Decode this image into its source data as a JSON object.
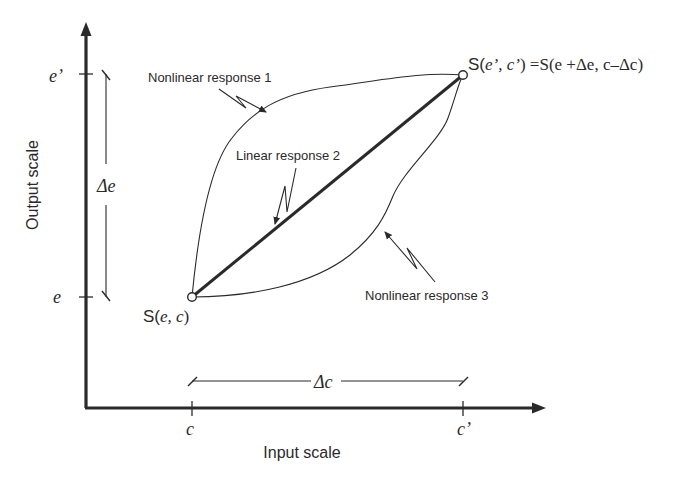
{
  "axes": {
    "x_label": "Input scale",
    "y_label": "Output scale",
    "x_ticks": [
      {
        "label": "c",
        "position": "input start"
      },
      {
        "label": "c’",
        "position": "input end"
      }
    ],
    "y_ticks": [
      {
        "label": "e",
        "position": "output start"
      },
      {
        "label": "e’",
        "position": "output end"
      }
    ]
  },
  "intervals": {
    "delta_e": "Δe",
    "delta_c": "Δc"
  },
  "points": {
    "start": {
      "prefix": "S(",
      "args": "e, c",
      "suffix": ")"
    },
    "end": {
      "prefix": "S(",
      "args": "e’, c’",
      "suffix": ") =S(e +Δe, c–Δc)"
    }
  },
  "curves": [
    {
      "id": 1,
      "label": "Nonlinear response 1",
      "style": "thin curve, bulging above"
    },
    {
      "id": 2,
      "label": "Linear response 2",
      "style": "thick straight line"
    },
    {
      "id": 3,
      "label": "Nonlinear response 3",
      "style": "thin curve, bulging below"
    }
  ],
  "colors": {
    "ink": "#2a2a2a",
    "background": "#ffffff"
  }
}
